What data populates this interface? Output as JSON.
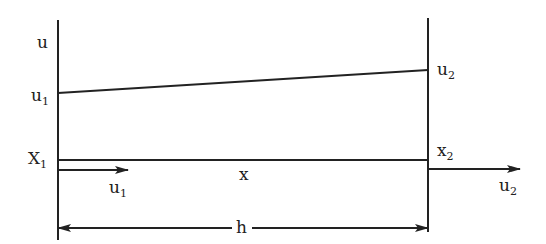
{
  "diagram": {
    "type": "one-dimensional linear element displacement diagram",
    "labels": {
      "axis_u": "u",
      "u1_left": {
        "base": "u",
        "sub": "1"
      },
      "u2_right": {
        "base": "u",
        "sub": "2"
      },
      "node1": {
        "base": "X",
        "sub": "1"
      },
      "node2": {
        "base": "x",
        "sub": "2"
      },
      "coord_x": "x",
      "arrow_u1": {
        "base": "u",
        "sub": "1"
      },
      "arrow_u2": {
        "base": "u",
        "sub": "2"
      },
      "length": "h"
    },
    "colors": {
      "stroke": "#222222",
      "background": "#ffffff"
    }
  }
}
